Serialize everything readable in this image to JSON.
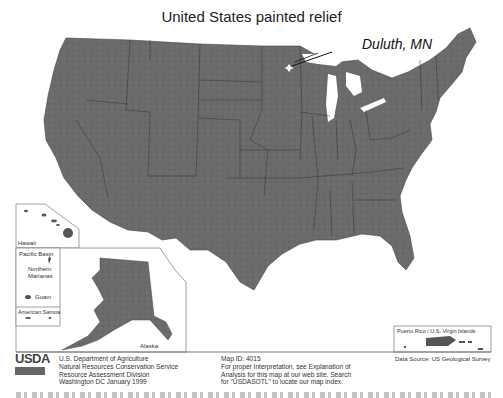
{
  "map": {
    "title": "United States painted relief",
    "callout": {
      "label": "Duluth, MN",
      "marker": "star-marker"
    },
    "colors": {
      "land": "#6a6a6a",
      "land_dark": "#555555",
      "border": "#333333",
      "water": "#ffffff",
      "inset_border": "#888888"
    }
  },
  "insets": {
    "hawaii": {
      "label": "Hawaii"
    },
    "pacific_basin": {
      "label": "Pacific Basin",
      "northern_marianas": "Northern Marianas",
      "guam": "Guam",
      "american_samoa": "American Samoa"
    },
    "alaska": {
      "label": "Alaska"
    },
    "puerto_rico": {
      "label": "Puerto Rico / U.S. Virgin Islands"
    }
  },
  "footer": {
    "logo": "USDA",
    "agency": [
      "U.S. Department of Agriculture",
      "Natural Resources Conservation Service",
      "Resource Assessment Division",
      "Washington DC  January 1999"
    ],
    "map_info": [
      "Map ID: 4015",
      "For proper Interpretation, see Explanation of",
      "Analysis for this map at our web site. Search",
      "for \"USDASOTL\" to locate our map index."
    ],
    "data_source": "Data Source: US Geological Survey"
  }
}
